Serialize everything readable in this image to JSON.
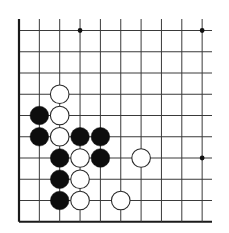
{
  "board": {
    "title": "Go board diagram (corner position)",
    "columns": 10,
    "rows": 10,
    "colors": {
      "background": "#ffffff",
      "line": "#3a3a3a",
      "edge": "#1a1a1a",
      "black_stone": "#0d0d0d",
      "white_stone_fill": "#ffffff",
      "white_stone_stroke": "#2a2a2a",
      "star_point": "#111111"
    },
    "edges": {
      "left": true,
      "bottom": true,
      "top": false,
      "right": false
    },
    "star_points": [
      {
        "col": 3,
        "row": 0
      },
      {
        "col": 9,
        "row": 0
      },
      {
        "col": 9,
        "row": 6
      }
    ],
    "stones": [
      {
        "color": "white",
        "col": 2,
        "row": 3
      },
      {
        "color": "white",
        "col": 2,
        "row": 4
      },
      {
        "color": "white",
        "col": 2,
        "row": 5
      },
      {
        "color": "white",
        "col": 3,
        "row": 6
      },
      {
        "color": "white",
        "col": 3,
        "row": 7
      },
      {
        "color": "white",
        "col": 3,
        "row": 8
      },
      {
        "color": "white",
        "col": 6,
        "row": 6
      },
      {
        "color": "white",
        "col": 5,
        "row": 8
      },
      {
        "color": "black",
        "col": 1,
        "row": 4
      },
      {
        "color": "black",
        "col": 1,
        "row": 5
      },
      {
        "color": "black",
        "col": 3,
        "row": 5
      },
      {
        "color": "black",
        "col": 4,
        "row": 5
      },
      {
        "color": "black",
        "col": 2,
        "row": 6
      },
      {
        "color": "black",
        "col": 4,
        "row": 6
      },
      {
        "color": "black",
        "col": 2,
        "row": 7
      },
      {
        "color": "black",
        "col": 2,
        "row": 8
      }
    ]
  }
}
